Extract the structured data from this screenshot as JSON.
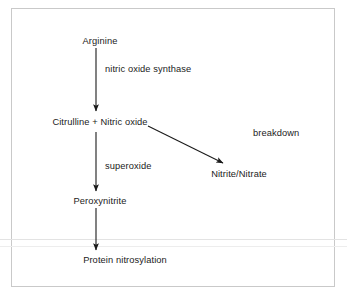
{
  "diagram": {
    "background_color": "#ffffff",
    "border_color": "#c9c9c9",
    "text_color": "#1b1b1b",
    "arrow_color": "#1b1b1b",
    "nodes": [
      {
        "id": "arginine",
        "label": "Arginine"
      },
      {
        "id": "citrulline-nitric-oxide",
        "label": "Citrulline + Nitric oxide"
      },
      {
        "id": "nitrite-nitrate",
        "label": "Nitrite/Nitrate"
      },
      {
        "id": "peroxynitrite",
        "label": "Peroxynitrite"
      },
      {
        "id": "protein-nitrosylation",
        "label": "Protein nitrosylation"
      }
    ],
    "edge_labels": [
      {
        "id": "nitric-oxide-synthase",
        "label": "nitric oxide synthase"
      },
      {
        "id": "breakdown",
        "label": "breakdown"
      },
      {
        "id": "superoxide",
        "label": "superoxide"
      }
    ],
    "edges": [
      {
        "from": "arginine",
        "to": "citrulline-nitric-oxide",
        "label": "nitric oxide synthase"
      },
      {
        "from": "citrulline-nitric-oxide",
        "to": "nitrite-nitrate",
        "label": "breakdown"
      },
      {
        "from": "citrulline-nitric-oxide",
        "to": "peroxynitrite",
        "label": "superoxide"
      },
      {
        "from": "peroxynitrite",
        "to": "protein-nitrosylation",
        "label": ""
      }
    ]
  }
}
